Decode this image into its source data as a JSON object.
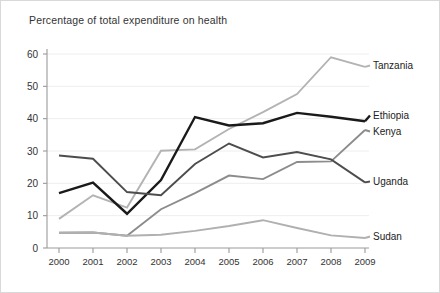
{
  "chart_data": {
    "type": "line",
    "title": "Percentage of total expenditure on health",
    "xlabel": "",
    "ylabel": "",
    "xlim": [
      2000,
      2009
    ],
    "ylim": [
      0,
      63
    ],
    "grid": true,
    "legend_position": "right-of-line-end",
    "categories": [
      "2000",
      "2001",
      "2002",
      "2003",
      "2004",
      "2005",
      "2006",
      "2007",
      "2008",
      "2009"
    ],
    "x": [
      2000,
      2001,
      2002,
      2003,
      2004,
      2005,
      2006,
      2007,
      2008,
      2009
    ],
    "yticks": [
      0,
      10,
      20,
      30,
      40,
      50,
      60
    ],
    "series": [
      {
        "name": "Tanzania",
        "color": "#b3b3b3",
        "width": 1.9,
        "values": [
          9.0,
          16.3,
          12.5,
          30.1,
          30.5,
          36.8,
          42.0,
          47.6,
          59.0,
          56.0
        ]
      },
      {
        "name": "Ethiopia",
        "color": "#1a1a1a",
        "width": 2.4,
        "values": [
          17.0,
          20.2,
          10.6,
          21.0,
          40.5,
          37.9,
          38.6,
          41.8,
          40.6,
          39.2
        ]
      },
      {
        "name": "Kenya",
        "color": "#8c8c8c",
        "width": 1.9,
        "values": [
          4.7,
          4.8,
          3.8,
          12.0,
          17.0,
          22.4,
          21.3,
          26.6,
          26.8,
          36.5
        ]
      },
      {
        "name": "Uganda",
        "color": "#4d4d4d",
        "width": 1.9,
        "values": [
          28.6,
          27.6,
          17.3,
          16.3,
          26.0,
          32.3,
          28.0,
          29.7,
          27.4,
          20.3
        ]
      },
      {
        "name": "Sudan",
        "color": "#b0b0b0",
        "width": 1.9,
        "values": [
          4.7,
          4.8,
          3.8,
          4.1,
          5.3,
          6.8,
          8.6,
          6.2,
          3.9,
          3.1
        ]
      }
    ],
    "label_anchors": [
      {
        "name": "Tanzania",
        "x": 372,
        "y": 68
      },
      {
        "name": "Ethiopia",
        "x": 372,
        "y": 118
      },
      {
        "name": "Kenya",
        "x": 372,
        "y": 134
      },
      {
        "name": "Uganda",
        "x": 372,
        "y": 184
      },
      {
        "name": "Sudan",
        "x": 372,
        "y": 239
      }
    ]
  }
}
